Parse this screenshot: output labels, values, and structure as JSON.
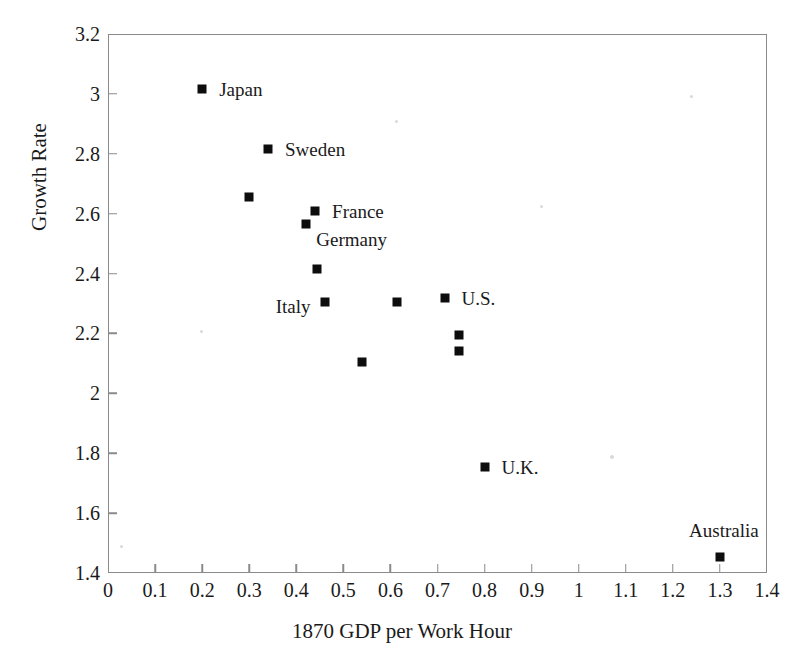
{
  "chart_data": {
    "type": "scatter",
    "title": "",
    "xlabel": "1870 GDP per Work Hour",
    "ylabel": "Growth Rate",
    "xlim": [
      0,
      1.4
    ],
    "ylim": [
      1.4,
      3.2
    ],
    "xticks": [
      "0",
      "0.1",
      "0.2",
      "0.3",
      "0.4",
      "0.5",
      "0.6",
      "0.7",
      "0.8",
      "0.9",
      "1",
      "1.1",
      "1.2",
      "1.3",
      "1.4"
    ],
    "xtick_values": [
      0,
      0.1,
      0.2,
      0.3,
      0.4,
      0.5,
      0.6,
      0.7,
      0.8,
      0.9,
      1.0,
      1.1,
      1.2,
      1.3,
      1.4
    ],
    "yticks": [
      "3.2",
      "3",
      "2.8",
      "2.6",
      "2.4",
      "2.2",
      "2",
      "1.8",
      "1.6",
      "1.4"
    ],
    "ytick_values": [
      3.2,
      3.0,
      2.8,
      2.6,
      2.4,
      2.2,
      2.0,
      1.8,
      1.6,
      1.4
    ],
    "grid": false,
    "legend": null,
    "marker_color": "#0d0d0d",
    "marker_shape": "square",
    "frame_color": "#8a8a8a",
    "points": [
      {
        "label": "Japan",
        "x": 0.2,
        "y": 3.015,
        "label_pos": "right"
      },
      {
        "label": "Sweden",
        "x": 0.34,
        "y": 2.815,
        "label_pos": "right"
      },
      {
        "label": "",
        "x": 0.3,
        "y": 2.655,
        "label_pos": "none"
      },
      {
        "label": "France",
        "x": 0.44,
        "y": 2.61,
        "label_pos": "right"
      },
      {
        "label": "Germany",
        "x": 0.42,
        "y": 2.565,
        "label_pos": "below"
      },
      {
        "label": "",
        "x": 0.445,
        "y": 2.415,
        "label_pos": "none"
      },
      {
        "label": "Italy",
        "x": 0.46,
        "y": 2.305,
        "label_pos": "left"
      },
      {
        "label": "",
        "x": 0.615,
        "y": 2.305,
        "label_pos": "none"
      },
      {
        "label": "U.S.",
        "x": 0.715,
        "y": 2.32,
        "label_pos": "right"
      },
      {
        "label": "",
        "x": 0.745,
        "y": 2.195,
        "label_pos": "none"
      },
      {
        "label": "",
        "x": 0.745,
        "y": 2.14,
        "label_pos": "none"
      },
      {
        "label": "",
        "x": 0.54,
        "y": 2.105,
        "label_pos": "none"
      },
      {
        "label": "U.K.",
        "x": 0.8,
        "y": 1.755,
        "label_pos": "right"
      },
      {
        "label": "Australia",
        "x": 1.3,
        "y": 1.455,
        "label_pos": "above"
      }
    ]
  }
}
